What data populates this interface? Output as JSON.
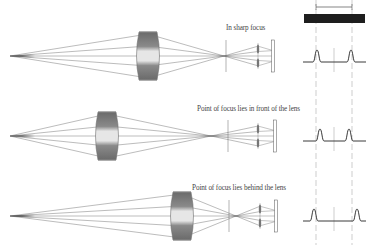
{
  "colors": {
    "ray": "#555555",
    "lens_edge": "#6f6f6f",
    "lens_center": "#eeeeee",
    "profile": "#3a3a3a",
    "guide": "#9a9a9a",
    "bar": "#1e1e1e",
    "text": "#444444"
  },
  "rows": [
    {
      "id": "sharp",
      "label": "In sharp focus",
      "label_x": 226,
      "label_y": 24,
      "axis_y": 56,
      "source_x": 10,
      "lens_x": 148,
      "focus_x": 224,
      "plane_x": 226,
      "microlens_x": 258,
      "sensor_x": 273,
      "profile_baseline_y": 62,
      "peaks_x": [
        317,
        351
      ]
    },
    {
      "id": "front",
      "label": "Point of focus lies in front of the lens",
      "label_x": 197,
      "label_y": 105,
      "axis_y": 136,
      "source_x": 10,
      "lens_x": 107,
      "focus_x": 211,
      "plane_x": 228,
      "microlens_x": 258,
      "sensor_x": 275,
      "profile_baseline_y": 141,
      "peaks_x": [
        320,
        349
      ]
    },
    {
      "id": "behind",
      "label": "Point of focus lies behind the lens",
      "label_x": 192,
      "label_y": 184,
      "axis_y": 216,
      "source_x": 10,
      "lens_x": 182,
      "focus_x": 236,
      "plane_x": 229,
      "microlens_x": 260,
      "sensor_x": 276,
      "profile_baseline_y": 221,
      "peaks_x": [
        314,
        357
      ]
    }
  ],
  "reference": {
    "bar": {
      "x": 304,
      "y": 14,
      "w": 61,
      "h": 9
    },
    "dimension": {
      "x1": 316,
      "x2": 352,
      "y": 7
    },
    "guide_lines_x": [
      316,
      352
    ],
    "center_lines_x": [
      334
    ]
  }
}
